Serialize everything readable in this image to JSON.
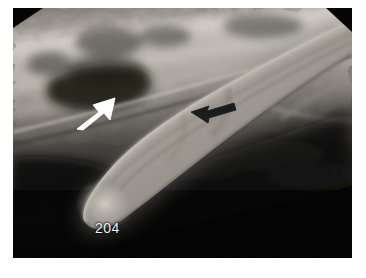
{
  "image": {
    "kind": "dental-radiograph",
    "modality": "intraoral radiograph",
    "subject": "curved equine incisor / canine tooth",
    "background_color": "#ffffff",
    "plate": {
      "x": 13,
      "y": 8,
      "width": 339,
      "height": 250,
      "base_color": "#050505",
      "corner_clips": [
        {
          "name": "top-left",
          "width": 30,
          "height": 20
        },
        {
          "name": "top-right",
          "width": 26,
          "height": 24
        }
      ]
    },
    "regions": [
      {
        "name": "alveolar-bone-upper",
        "description": "bright mottled bone and soft tissue occupying the upper band of the film",
        "tone": "#b8b4ad"
      },
      {
        "name": "radiolucent-lower-right",
        "description": "very dark radiolucent soft tissue / air region filling the lower right",
        "tone": "#080808"
      },
      {
        "name": "tooth-body",
        "description": "long curved radiopaque tooth sweeping from upper right to lower left, rounded apex at lower left",
        "tone": "#9e9a93"
      },
      {
        "name": "pulp-cavity-shadow",
        "description": "faint darker longitudinal line within the tooth body",
        "tone": "#7c7871"
      }
    ]
  },
  "annotations": {
    "white_arrow": {
      "name": "white-arrow",
      "color": "#ffffff",
      "tip_x": 112,
      "tip_y": 97,
      "tail_x": 80,
      "tail_y": 122,
      "direction": "up-right",
      "points_at": "gingival margin / crown-root junction"
    },
    "black_arrow": {
      "name": "black-arrow",
      "color": "#1a1a1a",
      "tip_x": 192,
      "tip_y": 112,
      "tail_x": 232,
      "tail_y": 101,
      "direction": "left",
      "points_at": "tooth body lesion"
    },
    "tooth_label": {
      "name": "tooth-number-label",
      "text": "204",
      "color": "#f2f2f2",
      "x": 95,
      "y": 221,
      "font_size": 14
    }
  }
}
